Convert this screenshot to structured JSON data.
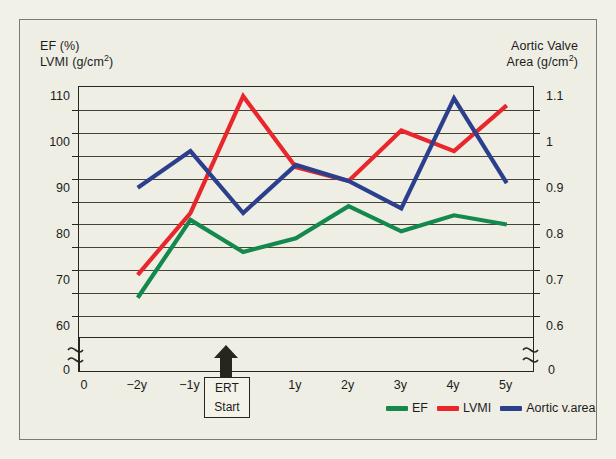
{
  "figure": {
    "background_color": "#efeee4",
    "axis_color": "#26261f"
  },
  "axis_titles": {
    "left_line1": "EF (%)",
    "left_line2_prefix": "LVMI (g/cm",
    "left_line2_sup": "2",
    "left_line2_suffix": ")",
    "right_line1": "Aortic Valve",
    "right_line2_prefix": "Area (g/cm",
    "right_line2_sup": "2",
    "right_line2_suffix": ")"
  },
  "annotation": {
    "ert_line1": "ERT",
    "ert_line2": "Start",
    "arrow_icon": "up-arrow-icon"
  },
  "legend": {
    "items": [
      {
        "label": "EF",
        "color": "#14894d"
      },
      {
        "label": "LVMI",
        "color": "#e8262c"
      },
      {
        "label": "Aortic v.area",
        "color": "#2c3f8c"
      }
    ]
  },
  "chart_data": {
    "type": "line",
    "title": "",
    "xlabel": "",
    "x_tick_labels": [
      "0",
      "−2y",
      "−1y",
      "",
      "1y",
      "2y",
      "3y",
      "4y",
      "5y"
    ],
    "categories": [
      "-2y",
      "-1y",
      "0y",
      "1y",
      "2y",
      "3y",
      "4y",
      "5y"
    ],
    "grid": true,
    "legend_position": "bottom-right",
    "left_axis": {
      "label": "EF (%) / LVMI (g/cm2)",
      "ticks": [
        "110",
        "100",
        "90",
        "80",
        "70",
        "60"
      ],
      "tick_values": [
        110,
        100,
        90,
        80,
        70,
        60
      ],
      "ylim": [
        57.5,
        112.5
      ],
      "minor_tick_step": 5,
      "break_below": true,
      "break_base_label": "0"
    },
    "right_axis": {
      "label": "Aortic Valve Area (g/cm2)",
      "ticks": [
        "1.1",
        "1",
        "0.9",
        "0.8",
        "0.7",
        "0.6"
      ],
      "tick_values": [
        1.1,
        1.0,
        0.9,
        0.8,
        0.7,
        0.6
      ],
      "ylim": [
        0.575,
        1.125
      ],
      "minor_tick_step": 0.05,
      "break_below": true,
      "break_base_label": "0"
    },
    "series": [
      {
        "name": "EF",
        "color": "#14894d",
        "axis": "left",
        "unit": "%",
        "values": [
          66.5,
          83.5,
          76.5,
          79.5,
          86.5,
          81.0,
          84.5,
          82.5
        ]
      },
      {
        "name": "LVMI",
        "color": "#e8262c",
        "axis": "left",
        "unit": "g/cm2",
        "values": [
          71.5,
          85.0,
          110.5,
          95.0,
          92.0,
          103.0,
          98.5,
          108.5
        ]
      },
      {
        "name": "Aortic v.area",
        "color": "#2c3f8c",
        "axis": "right",
        "unit": "g/cm2",
        "values": [
          0.905,
          0.985,
          0.85,
          0.955,
          0.92,
          0.86,
          1.1,
          0.915
        ]
      }
    ],
    "annotations": [
      {
        "text": "ERT Start",
        "x_category": "0y",
        "type": "arrow-marker"
      }
    ]
  }
}
